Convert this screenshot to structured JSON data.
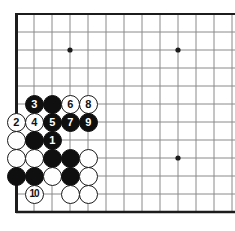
{
  "figure": {
    "kind": "go-board-diagram",
    "title": "",
    "board": {
      "line_color": "#8a8a8a",
      "edge_color": "#1c1c1c",
      "background_color": "#ffffff",
      "grid_spacing": 18,
      "origin_x": 16,
      "origin_y": 14,
      "columns": 13,
      "rows": 12,
      "edges": [
        "left",
        "top",
        "bottom"
      ],
      "star_points": [
        {
          "col": 3,
          "row": 2
        },
        {
          "col": 9,
          "row": 2
        },
        {
          "col": 9,
          "row": 8
        }
      ]
    },
    "stones": [
      {
        "col": 1,
        "row": 5,
        "color": "black",
        "label": "3"
      },
      {
        "col": 2,
        "row": 5,
        "color": "black",
        "label": ""
      },
      {
        "col": 3,
        "row": 5,
        "color": "white",
        "label": "6"
      },
      {
        "col": 4,
        "row": 5,
        "color": "white",
        "label": "8"
      },
      {
        "col": 0,
        "row": 6,
        "color": "white",
        "label": "2"
      },
      {
        "col": 1,
        "row": 6,
        "color": "white",
        "label": "4"
      },
      {
        "col": 2,
        "row": 6,
        "color": "black",
        "label": "5"
      },
      {
        "col": 3,
        "row": 6,
        "color": "black",
        "label": "7"
      },
      {
        "col": 4,
        "row": 6,
        "color": "black",
        "label": "9"
      },
      {
        "col": 0,
        "row": 7,
        "color": "white",
        "label": ""
      },
      {
        "col": 1,
        "row": 7,
        "color": "black",
        "label": ""
      },
      {
        "col": 2,
        "row": 7,
        "color": "black",
        "label": "1"
      },
      {
        "col": 0,
        "row": 8,
        "color": "white",
        "label": ""
      },
      {
        "col": 1,
        "row": 8,
        "color": "white",
        "label": ""
      },
      {
        "col": 2,
        "row": 8,
        "color": "black",
        "label": ""
      },
      {
        "col": 3,
        "row": 8,
        "color": "black",
        "label": ""
      },
      {
        "col": 4,
        "row": 8,
        "color": "white",
        "label": ""
      },
      {
        "col": 0,
        "row": 9,
        "color": "black",
        "label": ""
      },
      {
        "col": 1,
        "row": 9,
        "color": "black",
        "label": ""
      },
      {
        "col": 2,
        "row": 9,
        "color": "white",
        "label": ""
      },
      {
        "col": 3,
        "row": 9,
        "color": "black",
        "label": ""
      },
      {
        "col": 4,
        "row": 9,
        "color": "white",
        "label": ""
      },
      {
        "col": 1,
        "row": 10,
        "color": "white",
        "label": "10"
      },
      {
        "col": 3,
        "row": 10,
        "color": "white",
        "label": ""
      },
      {
        "col": 4,
        "row": 10,
        "color": "white",
        "label": ""
      }
    ],
    "move_sequence": [
      {
        "move": "1",
        "color": "black"
      },
      {
        "move": "2",
        "color": "white"
      },
      {
        "move": "3",
        "color": "black"
      },
      {
        "move": "4",
        "color": "white"
      },
      {
        "move": "5",
        "color": "black"
      },
      {
        "move": "6",
        "color": "white"
      },
      {
        "move": "7",
        "color": "black"
      },
      {
        "move": "8",
        "color": "white"
      },
      {
        "move": "9",
        "color": "black"
      },
      {
        "move": "10",
        "color": "white"
      }
    ]
  }
}
